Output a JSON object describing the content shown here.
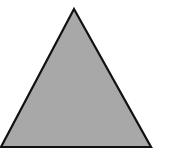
{
  "shape": {
    "type": "triangle",
    "fill": "#a8a8a8",
    "stroke": "#111111",
    "points": [
      [
        74,
        9
      ],
      [
        1,
        147
      ],
      [
        151,
        147
      ]
    ]
  }
}
